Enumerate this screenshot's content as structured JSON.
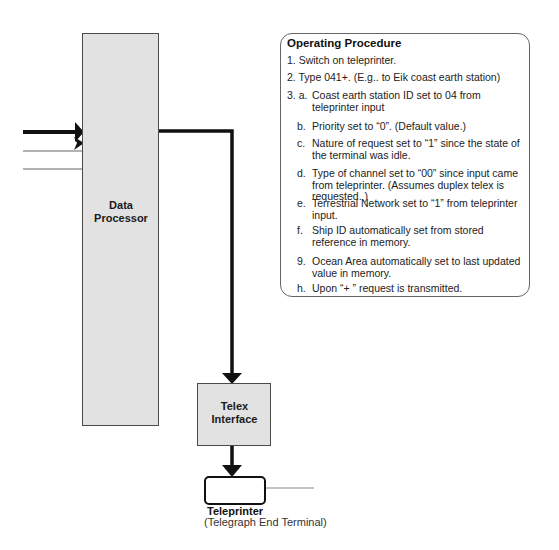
{
  "diagram": {
    "blocks": {
      "data_processor": {
        "line1": "Data",
        "line2": "Processor"
      },
      "telex_interface": {
        "line1": "Telex",
        "line2": "Interface"
      },
      "teleprinter": {
        "title": "Teleprinter",
        "subtitle": "(Telegraph End Terminal)"
      }
    },
    "colors": {
      "block_fill": "#e2e2e2",
      "block_border": "#4a4a4a",
      "wire": "#111111",
      "thin_wire": "#999999"
    }
  },
  "procedure": {
    "title": "Operating Procedure",
    "steps": [
      {
        "num": "1.",
        "text": "Switch on teleprinter."
      },
      {
        "num": "2.",
        "text": "Type 041+. (E.g.. to Eik coast earth station)"
      },
      {
        "num": "3. a.",
        "text": "Coast earth station ID set to 04 from teleprinter input"
      },
      {
        "num": "b.",
        "text": "Priority set to “0”. (Default value.)"
      },
      {
        "num": "c.",
        "text": "Nature of request set to “1” since the state of the terminal was idle."
      },
      {
        "num": "d.",
        "text": "Type of channel set to “00” since input came from teleprinter. (Assumes duplex telex is requested. )"
      },
      {
        "num": "e.",
        "text": "Terrestrial Network set to “1” from teleprinter input."
      },
      {
        "num": "f.",
        "text": "Ship ID automatically set from stored reference in memory."
      },
      {
        "num": "9.",
        "text": "Ocean Area automatically set to last updated value in memory."
      },
      {
        "num": "h.",
        "text": "Upon “+ ” request is transmitted."
      }
    ]
  }
}
